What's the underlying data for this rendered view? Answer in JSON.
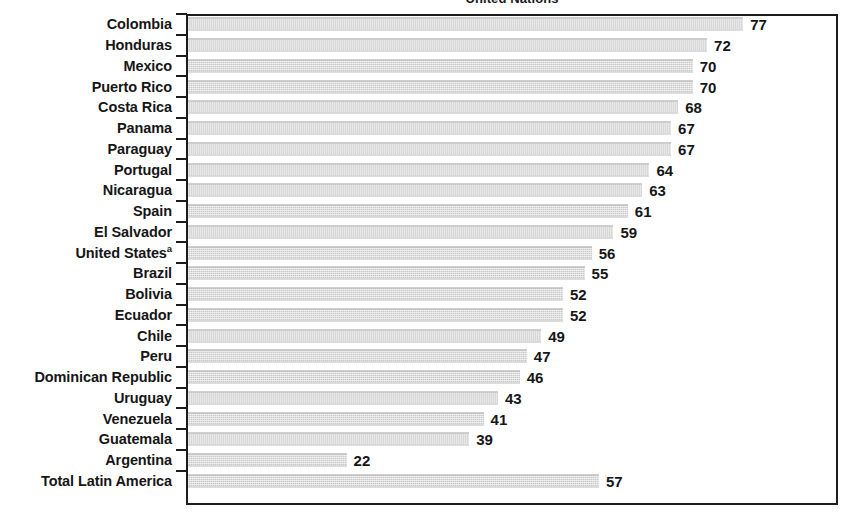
{
  "chart_data": {
    "type": "bar",
    "orientation": "horizontal",
    "title": "United Nations",
    "xlabel": "",
    "ylabel": "",
    "xlim": [
      0,
      90
    ],
    "grid": false,
    "legend": null,
    "value_labels": true,
    "footnote_marker": "a",
    "categories": [
      "Colombia",
      "Honduras",
      "Mexico",
      "Puerto Rico",
      "Costa Rica",
      "Panama",
      "Paraguay",
      "Portugal",
      "Nicaragua",
      "Spain",
      "El Salvador",
      "United States",
      "Brazil",
      "Bolivia",
      "Ecuador",
      "Chile",
      "Peru",
      "Dominican Republic",
      "Uruguay",
      "Venezuela",
      "Guatemala",
      "Argentina",
      "Total Latin America"
    ],
    "values": [
      77,
      72,
      70,
      70,
      68,
      67,
      67,
      64,
      63,
      61,
      59,
      56,
      55,
      52,
      52,
      49,
      47,
      46,
      43,
      41,
      39,
      22,
      57
    ]
  },
  "rows": [
    {
      "label": "Colombia",
      "sup": "",
      "value": 77
    },
    {
      "label": "Honduras",
      "sup": "",
      "value": 72
    },
    {
      "label": "Mexico",
      "sup": "",
      "value": 70
    },
    {
      "label": "Puerto Rico",
      "sup": "",
      "value": 70
    },
    {
      "label": "Costa Rica",
      "sup": "",
      "value": 68
    },
    {
      "label": "Panama",
      "sup": "",
      "value": 67
    },
    {
      "label": "Paraguay",
      "sup": "",
      "value": 67
    },
    {
      "label": "Portugal",
      "sup": "",
      "value": 64
    },
    {
      "label": "Nicaragua",
      "sup": "",
      "value": 63
    },
    {
      "label": "Spain",
      "sup": "",
      "value": 61
    },
    {
      "label": "El Salvador",
      "sup": "",
      "value": 59
    },
    {
      "label": "United States",
      "sup": "a",
      "value": 56
    },
    {
      "label": "Brazil",
      "sup": "",
      "value": 55
    },
    {
      "label": "Bolivia",
      "sup": "",
      "value": 52
    },
    {
      "label": "Ecuador",
      "sup": "",
      "value": 52
    },
    {
      "label": "Chile",
      "sup": "",
      "value": 49
    },
    {
      "label": "Peru",
      "sup": "",
      "value": 47
    },
    {
      "label": "Dominican Republic",
      "sup": "",
      "value": 46
    },
    {
      "label": "Uruguay",
      "sup": "",
      "value": 43
    },
    {
      "label": "Venezuela",
      "sup": "",
      "value": 41
    },
    {
      "label": "Guatemala",
      "sup": "",
      "value": 39
    },
    {
      "label": "Argentina",
      "sup": "",
      "value": 22
    },
    {
      "label": "Total Latin America",
      "sup": "",
      "value": 57
    }
  ],
  "style": {
    "bar_color": "#c9c9c9",
    "frame_color": "#1c1c1c",
    "text_color": "#161616",
    "background": "#ffffff",
    "px_per_unit": 7.21
  }
}
